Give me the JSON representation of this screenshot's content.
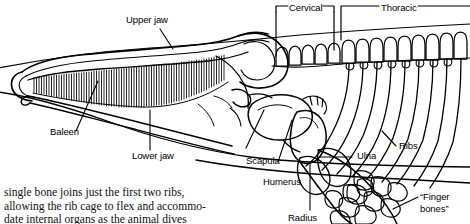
{
  "figure": {
    "kind": "anatomical-line-drawing",
    "ink_color": "#000000",
    "background_color": "#ffffff"
  },
  "labels": {
    "upper_jaw": "Upper jaw",
    "baleen": "Baleen",
    "lower_jaw": "Lower jaw",
    "cervical": "Cervical",
    "thoracic": "Thoracic",
    "scapula": "Scapula",
    "humerus": "Humerus",
    "radius": "Radius",
    "ulna": "Ulna",
    "ribs": "Ribs",
    "finger_bones_line1": "“Finger",
    "finger_bones_line2": "bones”"
  },
  "caption": {
    "line1": "single bone joins just the first two ribs,",
    "line2": "allowing the rib cage to flex and accommo-",
    "line3": "date internal organs as the animal dives"
  }
}
